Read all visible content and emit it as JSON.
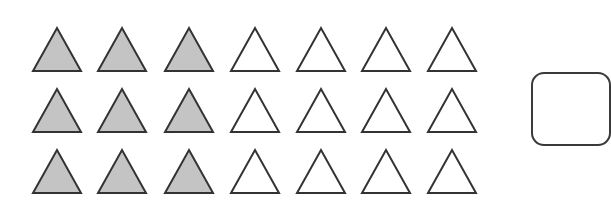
{
  "figure": {
    "rows": 3,
    "columns": 7,
    "shaded_per_row": 3,
    "unshaded_per_row": 4,
    "total_triangles": 21,
    "total_shaded": 9,
    "colors": {
      "shaded_fill": "#c4c4c4",
      "unshaded_fill": "#ffffff",
      "stroke": "#333333"
    },
    "layout": {
      "col_x": [
        33,
        98,
        165,
        231,
        297,
        362,
        428
      ],
      "row_base_y": [
        71,
        132,
        193
      ],
      "tri_width": 48,
      "tri_height": 43
    },
    "answer_box": {
      "content": ""
    }
  }
}
